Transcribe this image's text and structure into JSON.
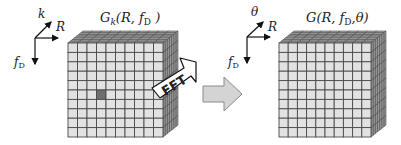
{
  "left_block": {
    "title_main": "G",
    "title_sub": "k",
    "title_args_pre": "(R, f",
    "title_args_sub": "D",
    "title_args_post": " )",
    "grid_rows": 10,
    "grid_cols": 10,
    "depth_layers": 7,
    "highlighted_cell": {
      "row": 5,
      "col": 3
    },
    "axes": {
      "diagonal_label": "k",
      "horizontal_label": "R",
      "vertical_label_main": "f",
      "vertical_label_sub": "D"
    }
  },
  "transform_arrow": {
    "label": "FFT"
  },
  "process_arrow": {
    "color": "#d4d4d4"
  },
  "right_block": {
    "title_pre": "G(R, f",
    "title_sub": "D",
    "title_post": ",θ)",
    "grid_rows": 10,
    "grid_cols": 10,
    "depth_layers": 7,
    "axes": {
      "diagonal_label": "θ",
      "horizontal_label": "R",
      "vertical_label_main": "f",
      "vertical_label_sub": "D"
    }
  },
  "colors": {
    "cell_fill": "#e2e2e2",
    "grid_line": "#4a4a4a",
    "side_fill": "#9a9a9a",
    "top_fill": "#a8a8a8",
    "highlight_fill": "#6e6e6e"
  }
}
